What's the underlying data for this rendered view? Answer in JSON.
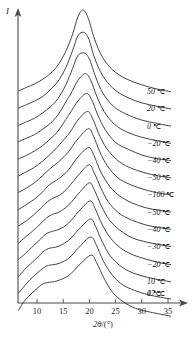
{
  "figure": {
    "y_axis_label": "I",
    "x_axis_label_main": "2θ",
    "x_axis_label_unit": "/(°)"
  },
  "chart_data": {
    "type": "line",
    "title": "",
    "subtitle": "",
    "xlabel": "2θ/(°)",
    "ylabel": "I",
    "xlim": [
      6,
      37
    ],
    "ylim": [
      0,
      1
    ],
    "grid": false,
    "legend_position": "right-inline",
    "x_ticks": [
      10,
      15,
      20,
      25,
      30,
      35
    ],
    "x_tick_labels": [
      "10",
      "15",
      "20",
      "25",
      "30",
      "35"
    ],
    "y_ticks": [],
    "y_tick_labels": [],
    "annotation_note": "Stacked (waterfall) XRD intensity curves, each offset vertically; curves labelled at right by measurement temperature",
    "series": [
      {
        "name": "50 ℃",
        "label": "50",
        "unit": "℃",
        "offset_index": 0,
        "peak_2theta": 18.8,
        "peak_height": 1.0,
        "shoulder_2theta": null,
        "x": [
          6.5,
          8.0,
          9.5,
          11.0,
          12.5,
          14.0,
          15.5,
          16.8,
          17.8,
          18.8,
          19.8,
          21.0,
          22.5,
          24.5,
          27.0,
          30.0,
          33.0,
          35.5
        ],
        "values": [
          0.06,
          0.1,
          0.14,
          0.19,
          0.26,
          0.36,
          0.52,
          0.72,
          0.92,
          1.0,
          0.9,
          0.66,
          0.45,
          0.3,
          0.2,
          0.13,
          0.08,
          0.05
        ]
      },
      {
        "name": "20 ℃",
        "label": "20",
        "unit": "℃",
        "offset_index": 1,
        "peak_2theta": 18.9,
        "peak_height": 0.94,
        "shoulder_2theta": null,
        "x": [
          6.5,
          8.0,
          9.5,
          11.0,
          12.5,
          14.0,
          15.5,
          16.8,
          17.8,
          18.9,
          19.9,
          21.0,
          22.5,
          24.5,
          27.0,
          30.0,
          33.0,
          35.5
        ],
        "values": [
          0.06,
          0.1,
          0.14,
          0.19,
          0.27,
          0.37,
          0.53,
          0.73,
          0.9,
          0.94,
          0.86,
          0.64,
          0.44,
          0.29,
          0.19,
          0.12,
          0.08,
          0.05
        ]
      },
      {
        "name": "0 ℃",
        "label": "0",
        "unit": "℃",
        "offset_index": 2,
        "peak_2theta": 19.0,
        "peak_height": 0.9,
        "shoulder_2theta": null,
        "x": [
          6.5,
          8.0,
          9.5,
          11.0,
          12.5,
          14.0,
          15.5,
          16.8,
          17.8,
          19.0,
          20.0,
          21.2,
          22.6,
          24.6,
          27.0,
          30.0,
          33.0,
          35.5
        ],
        "values": [
          0.06,
          0.1,
          0.14,
          0.2,
          0.27,
          0.37,
          0.53,
          0.72,
          0.87,
          0.9,
          0.83,
          0.62,
          0.43,
          0.28,
          0.19,
          0.12,
          0.08,
          0.05
        ]
      },
      {
        "name": "-20 ℃",
        "label": "−20",
        "unit": "℃",
        "offset_index": 3,
        "peak_2theta": 19.2,
        "peak_height": 0.86,
        "shoulder_2theta": 16.0,
        "x": [
          6.5,
          8.0,
          9.5,
          11.0,
          12.5,
          14.0,
          15.5,
          16.5,
          17.8,
          19.2,
          20.2,
          21.4,
          22.8,
          24.8,
          27.2,
          30.0,
          33.0,
          35.5
        ],
        "values": [
          0.07,
          0.11,
          0.15,
          0.21,
          0.28,
          0.38,
          0.53,
          0.63,
          0.78,
          0.86,
          0.79,
          0.6,
          0.42,
          0.27,
          0.18,
          0.12,
          0.08,
          0.05
        ]
      },
      {
        "name": "-40 ℃",
        "label": "−40",
        "unit": "℃",
        "offset_index": 4,
        "peak_2theta": 19.4,
        "peak_height": 0.83,
        "shoulder_2theta": 15.5,
        "x": [
          6.5,
          8.0,
          9.5,
          11.0,
          12.5,
          14.0,
          15.2,
          16.3,
          17.8,
          19.4,
          20.4,
          21.6,
          23.0,
          25.0,
          27.4,
          30.2,
          33.0,
          35.5
        ],
        "values": [
          0.07,
          0.11,
          0.16,
          0.22,
          0.3,
          0.39,
          0.5,
          0.6,
          0.74,
          0.83,
          0.76,
          0.58,
          0.41,
          0.26,
          0.18,
          0.11,
          0.07,
          0.05
        ]
      },
      {
        "name": "-50 ℃",
        "label": "−50",
        "unit": "℃",
        "offset_index": 5,
        "peak_2theta": 19.6,
        "peak_height": 0.82,
        "shoulder_2theta": 14.5,
        "x": [
          6.5,
          8.0,
          9.5,
          11.0,
          12.5,
          13.8,
          14.8,
          16.2,
          17.8,
          19.6,
          20.6,
          21.8,
          23.2,
          25.2,
          27.6,
          30.4,
          33.2,
          35.5
        ],
        "values": [
          0.07,
          0.12,
          0.17,
          0.24,
          0.32,
          0.4,
          0.47,
          0.57,
          0.72,
          0.82,
          0.74,
          0.56,
          0.4,
          0.26,
          0.17,
          0.11,
          0.07,
          0.05
        ]
      },
      {
        "name": "-100 ℃",
        "label": "−100",
        "unit": "℃",
        "offset_index": 6,
        "peak_2theta": 19.8,
        "peak_height": 0.82,
        "shoulder_2theta": 13.5,
        "x": [
          6.5,
          8.0,
          9.5,
          11.0,
          12.4,
          13.4,
          14.4,
          16.0,
          17.8,
          19.8,
          20.8,
          22.0,
          23.4,
          25.4,
          27.8,
          30.6,
          33.4,
          35.5
        ],
        "values": [
          0.08,
          0.13,
          0.19,
          0.27,
          0.35,
          0.4,
          0.45,
          0.55,
          0.7,
          0.82,
          0.73,
          0.55,
          0.39,
          0.25,
          0.17,
          0.11,
          0.07,
          0.05
        ]
      },
      {
        "name": "-50 ℃ (warming)",
        "label": "−50",
        "unit": "℃",
        "offset_index": 7,
        "peak_2theta": 19.8,
        "peak_height": 0.8,
        "shoulder_2theta": 13.2,
        "x": [
          6.5,
          8.0,
          9.5,
          11.0,
          12.2,
          13.2,
          14.4,
          16.0,
          17.8,
          19.8,
          20.8,
          22.0,
          23.5,
          25.5,
          28.0,
          30.8,
          33.4,
          35.5
        ],
        "values": [
          0.08,
          0.14,
          0.2,
          0.28,
          0.36,
          0.4,
          0.45,
          0.54,
          0.69,
          0.8,
          0.72,
          0.54,
          0.38,
          0.25,
          0.16,
          0.1,
          0.07,
          0.05
        ]
      },
      {
        "name": "-40 ℃ (warming)",
        "label": "−40",
        "unit": "℃",
        "offset_index": 8,
        "peak_2theta": 19.9,
        "peak_height": 0.8,
        "shoulder_2theta": 13.0,
        "x": [
          6.5,
          8.0,
          9.4,
          10.8,
          12.0,
          13.0,
          14.4,
          16.0,
          17.9,
          19.9,
          20.9,
          22.2,
          23.6,
          25.6,
          28.0,
          30.8,
          33.4,
          35.5
        ],
        "values": [
          0.09,
          0.15,
          0.22,
          0.3,
          0.37,
          0.41,
          0.45,
          0.54,
          0.68,
          0.8,
          0.71,
          0.53,
          0.37,
          0.24,
          0.16,
          0.1,
          0.07,
          0.05
        ]
      },
      {
        "name": "-30 ℃",
        "label": "−30",
        "unit": "℃",
        "offset_index": 9,
        "peak_2theta": 20.0,
        "peak_height": 0.79,
        "shoulder_2theta": 12.8,
        "x": [
          6.5,
          7.8,
          9.2,
          10.6,
          11.8,
          12.8,
          14.2,
          16.0,
          18.0,
          20.0,
          21.0,
          22.3,
          23.8,
          25.8,
          28.2,
          31.0,
          33.5,
          35.5
        ],
        "values": [
          0.09,
          0.16,
          0.23,
          0.31,
          0.38,
          0.42,
          0.45,
          0.53,
          0.67,
          0.79,
          0.7,
          0.52,
          0.36,
          0.24,
          0.15,
          0.1,
          0.07,
          0.05
        ]
      },
      {
        "name": "-20 ℃ (warming)",
        "label": "−20",
        "unit": "℃",
        "offset_index": 10,
        "peak_2theta": 20.1,
        "peak_height": 0.78,
        "shoulder_2theta": 12.6,
        "x": [
          6.5,
          7.8,
          9.0,
          10.4,
          11.6,
          12.6,
          14.2,
          16.0,
          18.0,
          20.1,
          21.1,
          22.4,
          24.0,
          26.0,
          28.4,
          31.0,
          33.5,
          35.5
        ],
        "values": [
          0.1,
          0.17,
          0.24,
          0.32,
          0.39,
          0.42,
          0.45,
          0.52,
          0.66,
          0.78,
          0.69,
          0.51,
          0.35,
          0.23,
          0.15,
          0.1,
          0.06,
          0.04
        ]
      },
      {
        "name": "10 ℃",
        "label": "10",
        "unit": "℃",
        "offset_index": 11,
        "peak_2theta": 20.2,
        "peak_height": 0.77,
        "shoulder_2theta": 12.4,
        "x": [
          6.5,
          7.6,
          8.8,
          10.2,
          11.4,
          12.4,
          14.0,
          16.0,
          18.0,
          20.2,
          21.2,
          22.5,
          24.0,
          26.0,
          28.4,
          31.2,
          33.6,
          35.5
        ],
        "values": [
          0.1,
          0.18,
          0.25,
          0.33,
          0.4,
          0.43,
          0.45,
          0.52,
          0.65,
          0.77,
          0.68,
          0.5,
          0.34,
          0.22,
          0.14,
          0.09,
          0.06,
          0.04
        ]
      },
      {
        "name": "0 ℃ (warming)",
        "label": "0",
        "unit": "℃",
        "offset_index": 12,
        "peak_2theta": 20.2,
        "peak_height": 0.76,
        "shoulder_2theta": 12.2,
        "x": [
          6.5,
          7.6,
          8.6,
          10.0,
          11.2,
          12.2,
          14.0,
          16.0,
          18.0,
          20.2,
          21.3,
          22.6,
          24.2,
          26.2,
          28.6,
          31.2,
          33.6,
          35.5
        ],
        "values": [
          0.11,
          0.19,
          0.26,
          0.34,
          0.4,
          0.43,
          0.45,
          0.51,
          0.64,
          0.76,
          0.67,
          0.49,
          0.33,
          0.21,
          0.14,
          0.09,
          0.06,
          0.04
        ]
      },
      {
        "name": "17 ℃",
        "label": "17",
        "unit": "℃",
        "offset_index": 13,
        "peak_2theta": 20.3,
        "peak_height": 0.75,
        "shoulder_2theta": 12.0,
        "x": [
          6.5,
          7.4,
          8.4,
          9.8,
          11.0,
          12.0,
          13.8,
          16.0,
          18.0,
          20.3,
          21.4,
          22.8,
          24.4,
          26.4,
          28.8,
          31.4,
          33.8,
          35.5
        ],
        "values": [
          0.11,
          0.2,
          0.27,
          0.35,
          0.41,
          0.43,
          0.45,
          0.51,
          0.63,
          0.75,
          0.66,
          0.48,
          0.32,
          0.21,
          0.13,
          0.09,
          0.06,
          0.04
        ]
      }
    ]
  }
}
